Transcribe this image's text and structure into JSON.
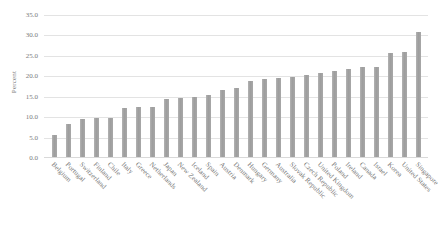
{
  "chart_data": {
    "type": "bar",
    "title": "",
    "xlabel": "",
    "ylabel": "Percent",
    "ylim": [
      0.0,
      35.0
    ],
    "ytick_step": 5.0,
    "ytick_labels": [
      "35.0",
      "30.0",
      "25.0",
      "20.0",
      "15.0",
      "10.0",
      "5.0",
      "0.0"
    ],
    "ytick_values": [
      35.0,
      30.0,
      25.0,
      20.0,
      15.0,
      10.0,
      5.0,
      0.0
    ],
    "grid": true,
    "grid_axis": "y",
    "legend": false,
    "legend_position": "none",
    "bar_color": "#a6a6a6",
    "grid_color": "#e3e3e3",
    "text_color": "#787878",
    "categories": [
      "Belgium",
      "Portugal",
      "Switzerland",
      "Finland",
      "Chile",
      "Italy",
      "Greece",
      "Netherlands",
      "Japan",
      "New Zealand",
      "Iceland",
      "Spain",
      "Austria",
      "Denmark",
      "Hungary",
      "Germany",
      "Australia",
      "Slovak Republic",
      "Czech Republic",
      "United Kingdom",
      "Poland",
      "Ireland",
      "Canada",
      "Israel",
      "Korea",
      "United States",
      "Singapore"
    ],
    "values": [
      5.5,
      8.0,
      9.3,
      9.5,
      9.5,
      12.0,
      12.2,
      12.3,
      14.3,
      14.5,
      14.7,
      15.3,
      16.5,
      16.8,
      18.5,
      19.0,
      19.3,
      19.5,
      20.0,
      20.5,
      21.0,
      21.5,
      22.0,
      22.0,
      25.5,
      25.8,
      30.6
    ]
  }
}
